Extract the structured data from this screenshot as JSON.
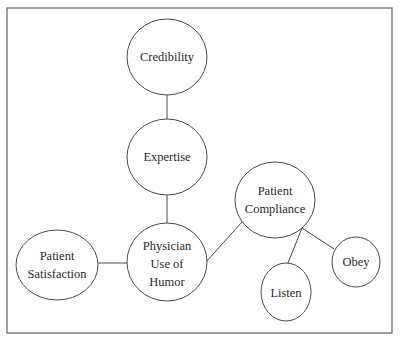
{
  "diagram": {
    "type": "concept-map",
    "frame": {
      "x": 7,
      "y": 8,
      "width": 385,
      "height": 325
    },
    "nodes": [
      {
        "id": "credibility",
        "lines": [
          "Credibility"
        ],
        "cx": 167,
        "cy": 57,
        "rx": 40,
        "ry": 38
      },
      {
        "id": "expertise",
        "lines": [
          "Expertise"
        ],
        "cx": 167,
        "cy": 157,
        "rx": 40,
        "ry": 38
      },
      {
        "id": "physician-use-of-humor",
        "lines": [
          "Physician",
          "Use of",
          "Humor"
        ],
        "cx": 167,
        "cy": 262,
        "rx": 40,
        "ry": 39
      },
      {
        "id": "patient-satisfaction",
        "lines": [
          "Patient",
          "Satisfaction"
        ],
        "cx": 57,
        "cy": 265,
        "rx": 41,
        "ry": 35
      },
      {
        "id": "patient-compliance",
        "lines": [
          "Patient",
          "Compliance"
        ],
        "cx": 275,
        "cy": 200,
        "rx": 40,
        "ry": 38
      },
      {
        "id": "listen",
        "lines": [
          "Listen"
        ],
        "cx": 286,
        "cy": 292,
        "rx": 25,
        "ry": 29
      },
      {
        "id": "obey",
        "lines": [
          "Obey"
        ],
        "cx": 356,
        "cy": 262,
        "rx": 24,
        "ry": 25
      }
    ],
    "edges": [
      {
        "from": "credibility",
        "to": "expertise",
        "x1": 167,
        "y1": 95,
        "x2": 167,
        "y2": 119
      },
      {
        "from": "expertise",
        "to": "physician-use-of-humor",
        "x1": 167,
        "y1": 195,
        "x2": 167,
        "y2": 223
      },
      {
        "from": "patient-satisfaction",
        "to": "physician-use-of-humor",
        "x1": 98,
        "y1": 263,
        "x2": 127,
        "y2": 263
      },
      {
        "from": "physician-use-of-humor",
        "to": "patient-compliance",
        "x1": 206,
        "y1": 262,
        "x2": 242,
        "y2": 222
      },
      {
        "from": "patient-compliance",
        "to": "listen",
        "x1": 302,
        "y1": 228,
        "x2": 288,
        "y2": 263
      },
      {
        "from": "patient-compliance",
        "to": "obey",
        "x1": 302,
        "y1": 228,
        "x2": 334,
        "y2": 249
      }
    ],
    "colors": {
      "stroke": "#4a4a4a",
      "frame": "#6e6e6e",
      "text": "#2a2a2a",
      "background": "#ffffff"
    }
  },
  "labels": {
    "credibility": {
      "line1": "Credibility"
    },
    "expertise": {
      "line1": "Expertise"
    },
    "physician": {
      "line1": "Physician",
      "line2": "Use of",
      "line3": "Humor"
    },
    "satisfaction": {
      "line1": "Patient",
      "line2": "Satisfaction"
    },
    "compliance": {
      "line1": "Patient",
      "line2": "Compliance"
    },
    "listen": {
      "line1": "Listen"
    },
    "obey": {
      "line1": "Obey"
    }
  }
}
